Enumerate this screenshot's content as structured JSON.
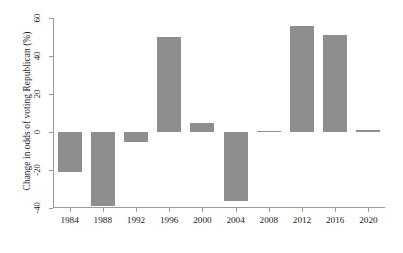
{
  "chart_data": {
    "type": "bar",
    "title": "",
    "xlabel": "",
    "ylabel": "Change in odds of voting Republican (%)",
    "categories": [
      "1984",
      "1988",
      "1992",
      "1996",
      "2000",
      "2004",
      "2008",
      "2012",
      "2016",
      "2020"
    ],
    "values": [
      -21,
      -39,
      -5,
      50,
      5,
      -36.5,
      0.5,
      56,
      51,
      1
    ],
    "ylim": [
      -40,
      60
    ],
    "yticks": [
      -40,
      -20,
      0,
      20,
      40,
      60
    ],
    "ytick_labels": [
      "-40",
      "-20",
      "0",
      "20",
      "40",
      "60"
    ],
    "grid": false,
    "legend": "none",
    "bar_color": "#8e8e8e",
    "axis_color": "#9a9a9a",
    "background": "#ffffff"
  }
}
